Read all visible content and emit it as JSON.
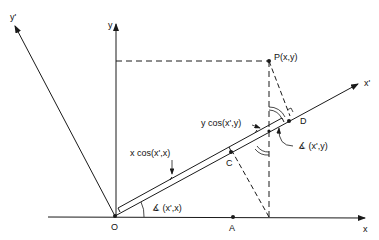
{
  "diagram": {
    "type": "coordinate-rotation-projection",
    "axes": {
      "x": "x",
      "y": "y",
      "x_prime": "x'",
      "y_prime": "y'"
    },
    "points": {
      "origin": "O",
      "P": "P(x,y)",
      "A": "A",
      "C": "C",
      "D": "D"
    },
    "annotations": {
      "x_projection": "x cos(x',x)",
      "y_projection": "y cos(x',y)",
      "angle_x": "∡ (x',x)",
      "angle_y": "∡ (x',y)"
    },
    "caption_fragment": "",
    "colors": {
      "line": "#1a1a1a",
      "background": "#ffffff"
    }
  }
}
